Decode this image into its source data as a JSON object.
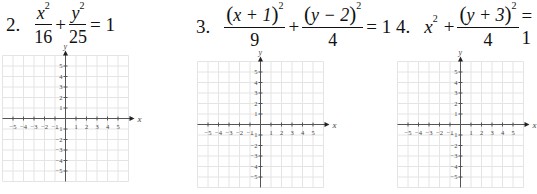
{
  "problems": [
    {
      "number": "2.",
      "equation_text": "x^2/16 + y^2/25 = 1",
      "term1": {
        "numerator_var": "x",
        "numerator_exp": "2",
        "denominator": "16"
      },
      "operator": "+",
      "term2": {
        "numerator_var": "y",
        "numerator_exp": "2",
        "denominator": "25"
      },
      "equals": "= 1"
    },
    {
      "number": "3.",
      "equation_text": "(x+1)^2/9 + (y-2)^2/4 = 1",
      "term1": {
        "numerator_open": "(",
        "numerator_inner": "x + 1",
        "numerator_close": ")",
        "numerator_exp": "2",
        "denominator": "9"
      },
      "operator": "+",
      "term2": {
        "numerator_open": "(",
        "numerator_inner": "y − 2",
        "numerator_close": ")",
        "numerator_exp": "2",
        "denominator": "4"
      },
      "equals": "= 1"
    },
    {
      "number": "4.",
      "equation_text": "x^2 + (y+3)^2/4 = 1",
      "term1": {
        "var": "x",
        "exp": "2"
      },
      "operator": "+",
      "term2": {
        "numerator_open": "(",
        "numerator_inner": "y + 3",
        "numerator_close": ")",
        "numerator_exp": "2",
        "denominator": "4"
      },
      "equals": "= 1"
    }
  ],
  "grids": [
    {
      "id": "grid-2",
      "x_label": "x",
      "y_label": "y",
      "x_ticks": [
        "−5",
        "−4",
        "−3",
        "−2",
        "−1",
        "1",
        "2",
        "3",
        "4",
        "5"
      ],
      "y_ticks": [
        "5",
        "4",
        "3",
        "2",
        "1",
        "−1",
        "−2",
        "−3",
        "−4",
        "−5"
      ]
    },
    {
      "id": "grid-3",
      "x_label": "x",
      "y_label": "y",
      "x_ticks": [
        "−5",
        "−4",
        "−3",
        "−2",
        "−1",
        "1",
        "2",
        "3",
        "4",
        "5"
      ],
      "y_ticks": [
        "5",
        "4",
        "3",
        "2",
        "1",
        "−1",
        "−2",
        "−3",
        "−4",
        "−5"
      ]
    },
    {
      "id": "grid-4",
      "x_label": "x",
      "y_label": "y",
      "x_ticks": [
        "−5",
        "−4",
        "−3",
        "−2",
        "−1",
        "1",
        "2",
        "3",
        "4",
        "5"
      ],
      "y_ticks": [
        "5",
        "4",
        "3",
        "2",
        "1",
        "−1",
        "−2",
        "−3",
        "−4",
        "−5"
      ]
    }
  ],
  "colors": {
    "grid_line": "#e4e4e4",
    "axis": "#555555",
    "text": "#111111"
  }
}
